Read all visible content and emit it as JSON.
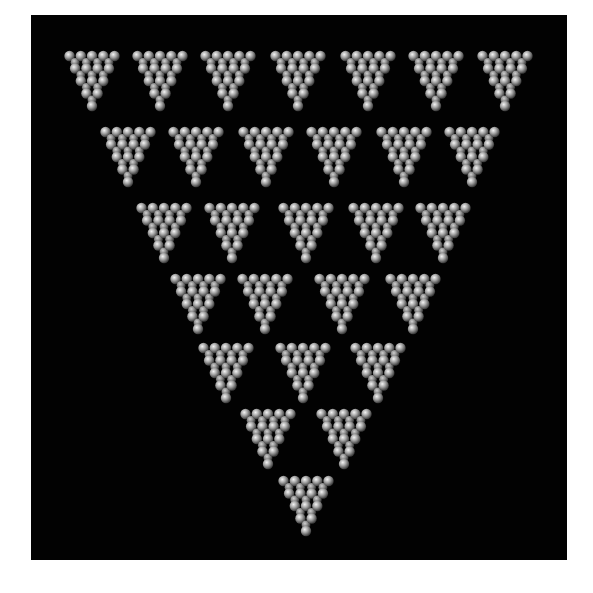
{
  "image": {
    "description": "Inverted triangular arrangement of 28 inverted triangles, each composed of clustered gray spheres, on a black background",
    "background_color": "#020202",
    "frame_color": "#ffffff",
    "sphere_color": "#bdbdbd",
    "sphere_highlight": "#f2f2f2",
    "sphere_shadow": "#4a4a4a"
  },
  "layout": {
    "rows": [
      {
        "count": 7,
        "y": 52,
        "xs": [
          92,
          160,
          228,
          298,
          368,
          436,
          505
        ]
      },
      {
        "count": 6,
        "y": 128,
        "xs": [
          128,
          196,
          266,
          334,
          404,
          472
        ]
      },
      {
        "count": 5,
        "y": 204,
        "xs": [
          164,
          232,
          306,
          376,
          443
        ]
      },
      {
        "count": 4,
        "y": 275,
        "xs": [
          198,
          265,
          342,
          413
        ]
      },
      {
        "count": 3,
        "y": 344,
        "xs": [
          226,
          303,
          378
        ]
      },
      {
        "count": 2,
        "y": 410,
        "xs": [
          268,
          344
        ]
      },
      {
        "count": 1,
        "y": 477,
        "xs": [
          306
        ]
      }
    ],
    "triangle_width": 55,
    "triangle_height": 60
  }
}
